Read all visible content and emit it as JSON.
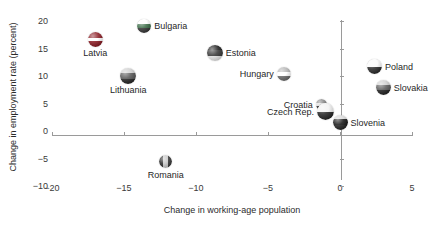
{
  "chart_data": {
    "type": "scatter",
    "title": "",
    "xlabel": "Change in working-age population",
    "ylabel": "Change in employment rate (percent)",
    "xlim": [
      -20,
      5
    ],
    "ylim": [
      -10,
      20
    ],
    "xticks": [
      -20,
      -15,
      -10,
      -5,
      0,
      5
    ],
    "xtick_labels": [
      "−20",
      "−15",
      "−10",
      "−5",
      "0",
      "5"
    ],
    "yticks": [
      -10,
      -5,
      0,
      5,
      10,
      15,
      20
    ],
    "ytick_labels": [
      "−10",
      "−5",
      "0",
      "5",
      "10",
      "15",
      "20"
    ],
    "grid": false,
    "legend": "none",
    "marker_style": "sphere-flag",
    "points": [
      {
        "label": "Latvia",
        "x": -17.0,
        "y": 16.7,
        "label_pos": "below",
        "size": 15,
        "flag": [
          "#8c1f27",
          "#ffffff",
          "#8c1f27"
        ],
        "flag_bands": [
          0.4,
          0.2,
          0.4
        ]
      },
      {
        "label": "Bulgaria",
        "x": -13.6,
        "y": 19.1,
        "label_pos": "right",
        "size": 14,
        "flag": [
          "#ffffff",
          "#3f6f4a",
          "#3a3a3a"
        ],
        "flag_bands": [
          0.34,
          0.33,
          0.33
        ]
      },
      {
        "label": "Lithuania",
        "x": -14.7,
        "y": 10.0,
        "label_pos": "below",
        "size": 16,
        "flag": [
          "#cfcfcf",
          "#5a5a5a",
          "#2a2a2a"
        ],
        "flag_bands": [
          0.34,
          0.33,
          0.33
        ]
      },
      {
        "label": "Romania",
        "x": -12.1,
        "y": -5.6,
        "label_pos": "below",
        "size": 13,
        "flag": [
          "#2e2e2e",
          "#c9c9c9",
          "#3d3d3d"
        ],
        "flag_bands": [
          0.33,
          0.34,
          0.33
        ],
        "vertical": true
      },
      {
        "label": "Estonia",
        "x": -8.7,
        "y": 14.2,
        "label_pos": "right",
        "size": 16,
        "flag": [
          "#1f1f1f",
          "#3a3a3a",
          "#e8e8e8"
        ],
        "flag_bands": [
          0.34,
          0.33,
          0.33
        ]
      },
      {
        "label": "Hungary",
        "x": -3.9,
        "y": 10.4,
        "label_pos": "left",
        "size": 14,
        "flag": [
          "#b5b5b5",
          "#ffffff",
          "#6d6d6d"
        ],
        "flag_bands": [
          0.34,
          0.33,
          0.33
        ]
      },
      {
        "label": "Croatia",
        "x": -1.3,
        "y": 4.9,
        "label_pos": "left",
        "size": 11,
        "flag": [
          "#8a8a8a",
          "#e0e0e0",
          "#3a3a3a"
        ],
        "flag_bands": [
          0.34,
          0.33,
          0.33
        ]
      },
      {
        "label": "Czech Rep.",
        "x": -1.0,
        "y": 3.5,
        "label_pos": "left",
        "size": 17,
        "flag": [
          "#f2f2f2",
          "#2a2a2a",
          "#2a2a2a"
        ],
        "flag_bands": [
          0.5,
          0.5,
          0.0
        ]
      },
      {
        "label": "Slovenia",
        "x": 0.0,
        "y": 1.6,
        "label_pos": "right",
        "size": 15,
        "flag": [
          "#d8d8d8",
          "#1c1c1c",
          "#2a2a2a"
        ],
        "flag_bands": [
          0.3,
          0.35,
          0.35
        ]
      },
      {
        "label": "Poland",
        "x": 2.4,
        "y": 11.8,
        "label_pos": "right",
        "size": 15,
        "flag": [
          "#fbfbfb",
          "#2e2e2e",
          "#2e2e2e"
        ],
        "flag_bands": [
          0.5,
          0.5,
          0.0
        ]
      },
      {
        "label": "Slovakia",
        "x": 3.0,
        "y": 8.0,
        "label_pos": "right",
        "size": 15,
        "flag": [
          "#cfcfcf",
          "#5f5f5f",
          "#262626"
        ],
        "flag_bands": [
          0.34,
          0.33,
          0.33
        ]
      }
    ]
  },
  "axis_colors": {
    "axis_line": "#9a9a9a",
    "tick_label": "#3a3a3a",
    "axis_title": "#2b2b2b",
    "point_label": "#1f1f1f"
  }
}
